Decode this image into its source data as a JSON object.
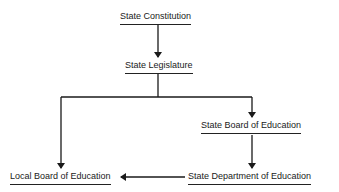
{
  "diagram": {
    "type": "organizational-flow",
    "nodes": [
      {
        "id": "constitution",
        "label": "State Constitution"
      },
      {
        "id": "legislature",
        "label": "State Legislature"
      },
      {
        "id": "state_board",
        "label": "State Board of Education"
      },
      {
        "id": "state_dept",
        "label": "State Department of Education"
      },
      {
        "id": "local_board",
        "label": "Local Board of Education"
      }
    ],
    "edges": [
      {
        "from": "constitution",
        "to": "legislature"
      },
      {
        "from": "legislature",
        "to": "local_board"
      },
      {
        "from": "legislature",
        "to": "state_board"
      },
      {
        "from": "state_board",
        "to": "state_dept"
      },
      {
        "from": "state_dept",
        "to": "local_board"
      }
    ],
    "line_color": "#1a1a1a"
  }
}
